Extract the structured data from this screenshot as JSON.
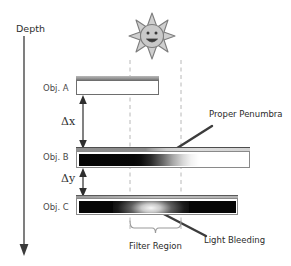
{
  "figure": {
    "background": "#ffffff",
    "width": 291,
    "height": 266
  },
  "axis": {
    "label": "Depth",
    "direction": "downward-arrow",
    "color": "#2e2e2e"
  },
  "light_source": {
    "name": "sun-icon",
    "rays": 8,
    "face": "smiley",
    "color": "#8c8c8c",
    "fill": "#c9c9c9"
  },
  "objects": [
    {
      "id": "A",
      "label": "Obj. A",
      "shading": "empty-white",
      "description": "unoccluded white slab"
    },
    {
      "id": "B",
      "label": "Obj. B",
      "shading": "black-to-white-gradient",
      "description": "slab showing proper penumbra falloff"
    },
    {
      "id": "C",
      "label": "Obj. C",
      "shading": "black-with-light-bleed",
      "description": "slab showing light bleeding artifact"
    }
  ],
  "measures": [
    {
      "id": "dx",
      "label": "Δx",
      "between": [
        "Obj. A",
        "Obj. B"
      ]
    },
    {
      "id": "dy",
      "label": "Δy",
      "between": [
        "Obj. B",
        "Obj. C"
      ]
    }
  ],
  "annotations": [
    {
      "id": "proper-penumbra",
      "label": "Proper Penumbra",
      "points_to": "Obj. B gradient",
      "color": "#3c3c3c"
    },
    {
      "id": "light-bleeding",
      "label": "Light Bleeding",
      "points_to": "Obj. C glow",
      "color": "#3c3c3c"
    },
    {
      "id": "filter-region",
      "label": "Filter Region",
      "marker": "curly-brace",
      "color": "#8a8a8a"
    }
  ],
  "guides": {
    "name": "filter-region-dashed-lines",
    "count": 2,
    "style": "dashed",
    "color": "#b4b4b4"
  }
}
